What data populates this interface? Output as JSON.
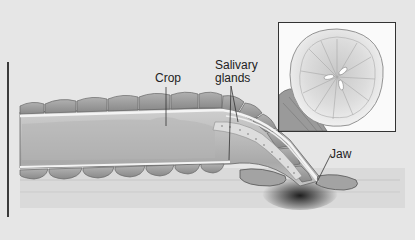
{
  "figure": {
    "labels": {
      "crop": "Crop",
      "salivary_line1": "Salivary",
      "salivary_line2": "glands",
      "jaw": "Jaw"
    },
    "inset": {
      "description": "Front view of oral sucker showing three-part jaw"
    }
  },
  "colors": {
    "background": "#e6e6e6",
    "body_fill": "#b9b9b9",
    "segment_fill": "#9d9d9d",
    "outline": "#555555",
    "gland_fill": "#d8d8d8",
    "shadow": "#2a2a2a",
    "inset_border": "#333333"
  }
}
